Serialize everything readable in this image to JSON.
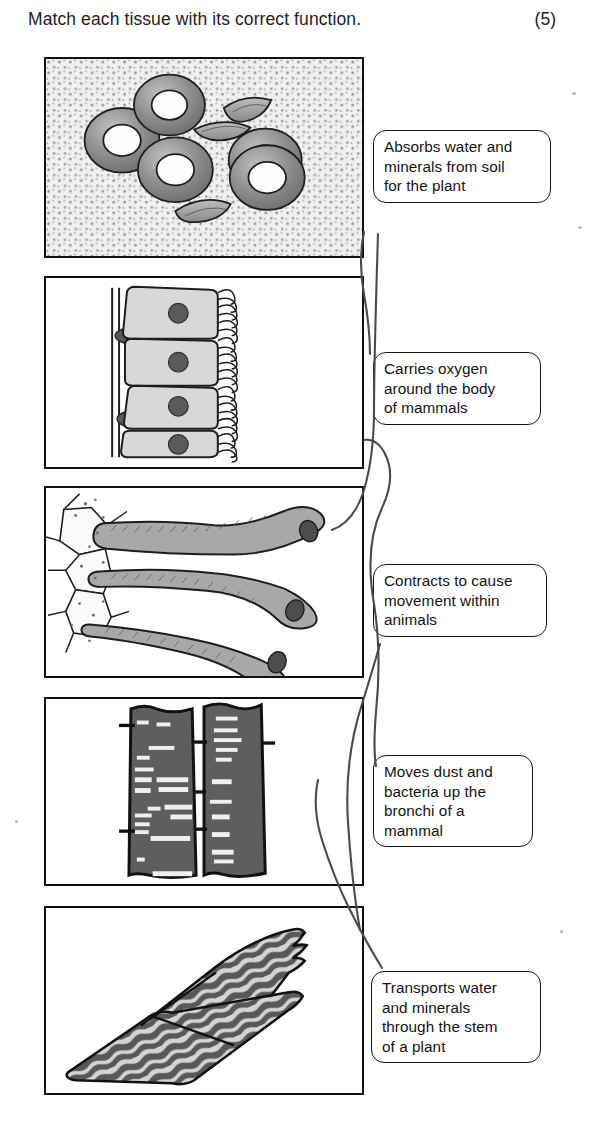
{
  "question": {
    "text": "Match each tissue with its correct function.",
    "marks": "(5)"
  },
  "panels": [
    {
      "id": "panel-blood-smear",
      "caption_alt": "blood smear with red blood cells and white blood cells",
      "x": 44,
      "y": 57,
      "w": 320,
      "h": 201
    },
    {
      "id": "panel-ciliated-epithelium",
      "caption_alt": "ciliated epithelial cells lining a membrane",
      "x": 44,
      "y": 276,
      "w": 320,
      "h": 193
    },
    {
      "id": "panel-root-hair-cells",
      "caption_alt": "root hair cells extending from plant root",
      "x": 44,
      "y": 486,
      "w": 320,
      "h": 192
    },
    {
      "id": "panel-xylem-vessels",
      "caption_alt": "xylem vessel elements with pitted walls",
      "x": 44,
      "y": 697,
      "w": 320,
      "h": 189
    },
    {
      "id": "panel-muscle-fibres",
      "caption_alt": "striated muscle fibres",
      "x": 44,
      "y": 906,
      "w": 320,
      "h": 189
    }
  ],
  "labels": [
    {
      "id": "label-absorbs-water",
      "lines": [
        "Absorbs water and",
        "minerals from soil",
        "for the plant"
      ],
      "x": 373,
      "y": 130,
      "w": 178,
      "h": 82
    },
    {
      "id": "label-carries-oxygen",
      "lines": [
        "Carries oxygen",
        "around the body",
        "of mammals"
      ],
      "x": 373,
      "y": 352,
      "w": 168,
      "h": 82
    },
    {
      "id": "label-contracts",
      "lines": [
        "Contracts to cause",
        "movement within",
        "animals"
      ],
      "x": 373,
      "y": 564,
      "w": 174,
      "h": 82
    },
    {
      "id": "label-moves-dust",
      "lines": [
        "Moves dust and",
        "bacteria up the",
        "bronchi of a",
        "mammal"
      ],
      "x": 373,
      "y": 755,
      "w": 160,
      "h": 101
    },
    {
      "id": "label-transports",
      "lines": [
        "Transports water",
        "and minerals",
        "through the stem",
        "of a plant"
      ],
      "x": 371,
      "y": 971,
      "w": 170,
      "h": 104
    }
  ],
  "connectors": [
    {
      "id": "connector-blood-to-carries-oxygen",
      "from": "panel-blood-smear",
      "to": "label-carries-oxygen"
    },
    {
      "id": "connector-epithelium-to-moves-dust",
      "from": "panel-ciliated-epithelium",
      "to": "label-moves-dust"
    },
    {
      "id": "connector-roothair-to-absorbs-water",
      "from": "panel-root-hair-cells",
      "to": "label-absorbs-water"
    },
    {
      "id": "connector-xylem-to-transports",
      "from": "panel-xylem-vessels",
      "to": "label-transports"
    },
    {
      "id": "connector-muscle-to-contracts",
      "from": "panel-muscle-fibres",
      "to": "label-contracts"
    }
  ],
  "colors": {
    "ink": "#161616",
    "connector": "#4a4a4a",
    "panel_border": "#111111",
    "cell_fill": "#9a9a9a",
    "dark_fill": "#5d5d5d",
    "smear_background": "#efefef",
    "paper": "#ffffff"
  }
}
